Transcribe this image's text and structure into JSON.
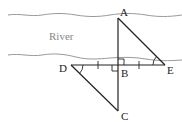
{
  "diagram": {
    "labels": {
      "A": "A",
      "B": "B",
      "C": "C",
      "D": "D",
      "E": "E",
      "river": "River"
    },
    "points": {
      "A": [
        118,
        18
      ],
      "B": [
        118,
        65
      ],
      "C": [
        118,
        111
      ],
      "D": [
        71,
        65
      ],
      "E": [
        165,
        65
      ]
    },
    "colors": {
      "line": "#222222",
      "bank": "#999999",
      "river_text": "#888888"
    }
  }
}
